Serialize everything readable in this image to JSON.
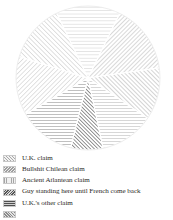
{
  "figure": {
    "title": "",
    "map_shape_name": "antarctica-landmass",
    "pole_label": "",
    "colors": {
      "landmass": "#dcdcdc",
      "hatch_light": "#a8a8a8",
      "hatch_dark": "#555555",
      "background": "#ffffff"
    },
    "wedges": [
      {
        "name": "wedge-uk-claim",
        "start_deg": -62,
        "end_deg": -8,
        "hatch_angle_deg": 45,
        "density": "light",
        "tone": "#b0b0b0"
      },
      {
        "name": "wedge-chilean-claim",
        "start_deg": -8,
        "end_deg": 34,
        "hatch_angle_deg": -45,
        "density": "light",
        "tone": "#a6a6a6"
      },
      {
        "name": "wedge-atlantean-claim",
        "start_deg": 34,
        "end_deg": 78,
        "hatch_angle_deg": 0,
        "density": "light",
        "tone": "#adadad"
      },
      {
        "name": "wedge-guy-standing",
        "start_deg": 78,
        "end_deg": 104,
        "hatch_angle_deg": -45,
        "density": "dark",
        "tone": "#5a5a5a"
      },
      {
        "name": "wedge-uk-other-claim",
        "start_deg": 104,
        "end_deg": 150,
        "hatch_angle_deg": 90,
        "density": "medium",
        "tone": "#8e8e8e"
      },
      {
        "name": "wedge-unlabelled-west",
        "start_deg": 150,
        "end_deg": 196,
        "hatch_angle_deg": 45,
        "density": "light",
        "tone": "#bcbcbc"
      },
      {
        "name": "wedge-unlabelled-nw",
        "start_deg": 196,
        "end_deg": 244,
        "hatch_angle_deg": -45,
        "density": "light",
        "tone": "#b5b5b5"
      },
      {
        "name": "wedge-unlabelled-north",
        "start_deg": 244,
        "end_deg": 298,
        "hatch_angle_deg": 0,
        "density": "light",
        "tone": "#c2c2c2"
      }
    ]
  },
  "legend": {
    "position": "below-figure",
    "items": [
      {
        "label": "U.K. claim",
        "swatch": "sw-uk",
        "swatch_name": "swatch-uk-claim"
      },
      {
        "label": "Bullshit Chilean claim",
        "swatch": "sw-chile",
        "swatch_name": "swatch-chilean-claim"
      },
      {
        "label": "Ancient Atlantean claim",
        "swatch": "sw-atlantis",
        "swatch_name": "swatch-atlantean-claim"
      },
      {
        "label": "Guy standing here until French come back",
        "swatch": "sw-guy",
        "swatch_name": "swatch-guy-standing"
      },
      {
        "label": "U.K.'s other claim",
        "swatch": "sw-uk2",
        "swatch_name": "swatch-uk-other-claim"
      },
      {
        "label": "",
        "swatch": "sw-extra",
        "swatch_name": "swatch-clipped-row"
      }
    ]
  }
}
